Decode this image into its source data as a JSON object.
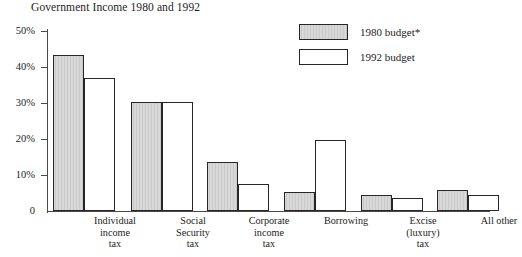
{
  "chart_data": {
    "type": "bar",
    "title": "Government Income 1980 and 1992",
    "xlabel": "",
    "ylabel": "",
    "ylim": [
      0,
      50
    ],
    "ytick_labels": [
      "0",
      "10%",
      "20%",
      "30%",
      "40%",
      "50%"
    ],
    "ytick_values": [
      0,
      10,
      20,
      30,
      40,
      50
    ],
    "grid": false,
    "legend_position": "top-right",
    "categories": [
      "Individual\nincome\ntax",
      "Social\nSecurity\ntax",
      "Corporate\nincome\ntax",
      "Borrowing",
      "Excise\n(luxury)\ntax",
      "All other"
    ],
    "series": [
      {
        "name": "1980 budget*",
        "color": "#c9c9c9",
        "values": [
          43.3,
          30.3,
          13.5,
          5.3,
          4.5,
          5.8
        ]
      },
      {
        "name": "1992 budget",
        "color": "#ffffff",
        "values": [
          37.0,
          30.3,
          7.4,
          19.6,
          3.5,
          4.5
        ]
      }
    ]
  },
  "axis": {
    "y_labels": [
      "50%",
      "40%",
      "30%",
      "20%",
      "10%",
      "0"
    ]
  },
  "categories": [
    {
      "line1": "Individual",
      "line2": "income",
      "line3": "tax"
    },
    {
      "line1": "Social",
      "line2": "Security",
      "line3": "tax"
    },
    {
      "line1": "Corporate",
      "line2": "income",
      "line3": "tax"
    },
    {
      "line1": "Borrowing",
      "line2": "",
      "line3": ""
    },
    {
      "line1": "Excise",
      "line2": "(luxury)",
      "line3": "tax"
    },
    {
      "line1": "All other",
      "line2": "",
      "line3": ""
    }
  ],
  "legend": {
    "items": [
      {
        "label": "1980 budget*"
      },
      {
        "label": "1992 budget"
      }
    ]
  }
}
